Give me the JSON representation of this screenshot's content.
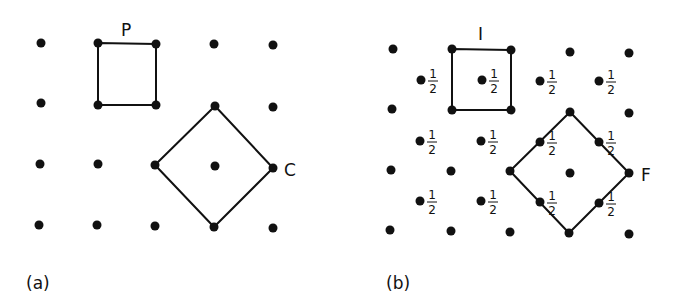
{
  "figure": {
    "panels": [
      {
        "id": "a",
        "caption": "(a)",
        "caption_pos": [
          26,
          289
        ],
        "lattice_dots": [
          [
            41,
            43
          ],
          [
            214,
            44
          ],
          [
            273,
            45
          ],
          [
            41,
            103
          ],
          [
            273,
            107
          ],
          [
            40,
            164
          ],
          [
            98,
            164
          ],
          [
            215,
            166
          ],
          [
            39,
            225
          ],
          [
            97,
            225
          ],
          [
            155,
            226
          ],
          [
            273,
            228
          ]
        ],
        "half_dots": [],
        "shapes": [
          {
            "name": "primitive-cell",
            "label": "P",
            "label_pos": [
              121,
              36
            ],
            "vertices": [
              [
                98,
                43
              ],
              [
                156,
                44
              ],
              [
                156,
                105
              ],
              [
                98,
                105
              ]
            ]
          },
          {
            "name": "centered-cell",
            "label": "C",
            "label_pos": [
              284,
              176
            ],
            "vertices": [
              [
                215,
                106
              ],
              [
                273,
                168
              ],
              [
                214,
                227
              ],
              [
                155,
                165
              ]
            ]
          }
        ]
      },
      {
        "id": "b",
        "caption": "(b)",
        "caption_pos": [
          386,
          289
        ],
        "lattice_dots": [
          [
            393,
            49
          ],
          [
            570,
            52
          ],
          [
            629,
            53
          ],
          [
            392,
            109
          ],
          [
            629,
            113
          ],
          [
            391,
            170
          ],
          [
            451,
            171
          ],
          [
            570,
            173
          ],
          [
            390,
            230
          ],
          [
            451,
            231
          ],
          [
            510,
            232
          ],
          [
            629,
            234
          ]
        ],
        "half_dots": [
          [
            421,
            80
          ],
          [
            482,
            80
          ],
          [
            540,
            81
          ],
          [
            599,
            81
          ],
          [
            420,
            141
          ],
          [
            481,
            141
          ],
          [
            420,
            201
          ],
          [
            481,
            201
          ]
        ],
        "edge_half_dots": [
          [
            540,
            142
          ],
          [
            599,
            142
          ],
          [
            540,
            202
          ],
          [
            599,
            203
          ]
        ],
        "half_label": {
          "num": "1",
          "den": "2"
        },
        "shapes": [
          {
            "name": "primitive-cell",
            "label": "I",
            "label_pos": [
              478,
              40
            ],
            "vertices": [
              [
                452,
                49
              ],
              [
                511,
                50
              ],
              [
                511,
                110
              ],
              [
                452,
                110
              ]
            ]
          },
          {
            "name": "centered-cell",
            "label": "F",
            "label_pos": [
              641,
              181
            ],
            "vertices": [
              [
                570,
                112
              ],
              [
                629,
                173
              ],
              [
                569,
                233
              ],
              [
                510,
                171
              ]
            ]
          }
        ]
      }
    ]
  }
}
